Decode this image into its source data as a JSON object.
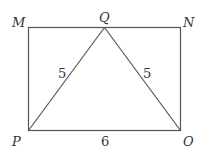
{
  "diagram": {
    "points": {
      "M": {
        "label": "M"
      },
      "Q": {
        "label": "Q"
      },
      "N": {
        "label": "N"
      },
      "P": {
        "label": "P"
      },
      "O": {
        "label": "O"
      }
    },
    "lengths": {
      "PQ": "5",
      "QO": "5",
      "PO": "6"
    },
    "colors": {
      "stroke": "#555555",
      "text": "#333333"
    }
  }
}
